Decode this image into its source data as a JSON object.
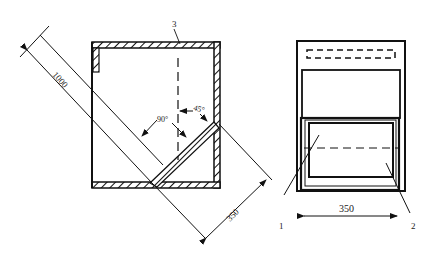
{
  "diagram": {
    "type": "engineering-drawing",
    "views": [
      {
        "name": "side-section-view",
        "labels": {
          "part_3": "3",
          "dim_length": "1000",
          "dim_width": "350",
          "angle_right": "90°",
          "angle_tilt": "45°"
        }
      },
      {
        "name": "front-view",
        "labels": {
          "part_1": "1",
          "part_2": "2",
          "dim_width": "350"
        }
      }
    ],
    "colors": {
      "line": "#111111",
      "background": "#ffffff"
    }
  }
}
